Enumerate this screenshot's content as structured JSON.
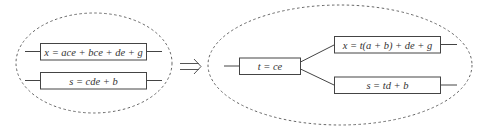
{
  "diagram": {
    "before": {
      "boxes": [
        {
          "label": "x = ace + bce + de + g"
        },
        {
          "label": "s = cde + b"
        }
      ]
    },
    "arrow": {
      "symbol": "⇒",
      "meaning": "transforms-to"
    },
    "after": {
      "factor_box": {
        "label": "t = ce"
      },
      "boxes": [
        {
          "label": "x = t(a + b) + de + g"
        },
        {
          "label": "s = td + b"
        }
      ]
    },
    "colors": {
      "stroke": "#444444",
      "dashed": "#666666",
      "background": "#ffffff"
    }
  }
}
